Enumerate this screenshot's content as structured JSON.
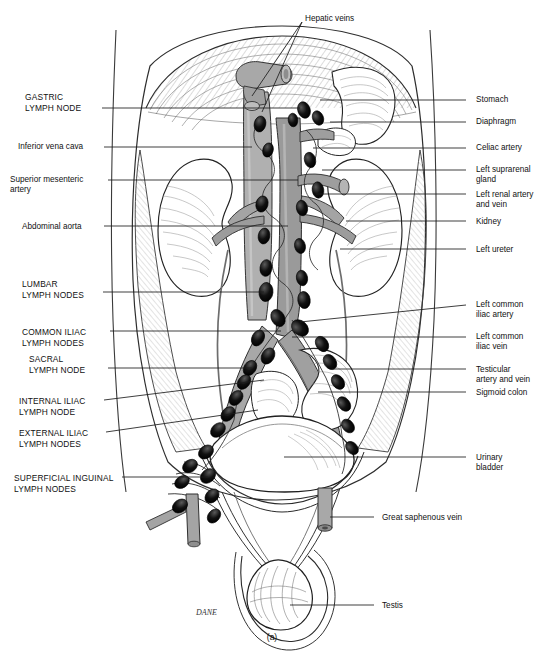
{
  "figure": {
    "caption": "(a)",
    "signature": "DANE"
  },
  "colors": {
    "ink": "#111111",
    "leader": "#222222",
    "vessel_light": "#b4b4b4",
    "vessel_mid": "#9a9a9a",
    "vessel_dark": "#7d7d7d",
    "node": "#000000",
    "hatch": "#7a7a7a",
    "background": "#ffffff"
  },
  "labels_left": [
    {
      "id": "gastric-lymph-node",
      "lines": [
        "GASTRIC",
        "LYMPH NODE"
      ],
      "caps": true,
      "x": 25,
      "y": 92,
      "lead_x1": 102,
      "lead_y1": 108,
      "lead_x2": 300,
      "lead_y2": 108
    },
    {
      "id": "inferior-vena-cava",
      "lines": [
        "Inferior vena cava"
      ],
      "caps": false,
      "x": 18,
      "y": 142,
      "lead_x1": 104,
      "lead_y1": 147,
      "lead_x2": 252,
      "lead_y2": 147
    },
    {
      "id": "superior-mesenteric-artery",
      "lines": [
        "Superior mesenteric",
        "artery"
      ],
      "caps": false,
      "x": 10,
      "y": 175,
      "lead_x1": 108,
      "lead_y1": 180,
      "lead_x2": 298,
      "lead_y2": 180
    },
    {
      "id": "abdominal-aorta",
      "lines": [
        "Abdominal aorta"
      ],
      "caps": false,
      "x": 22,
      "y": 222,
      "lead_x1": 104,
      "lead_y1": 226,
      "lead_x2": 288,
      "lead_y2": 226
    },
    {
      "id": "lumbar-lymph-nodes",
      "lines": [
        "LUMBAR",
        "LYMPH NODES"
      ],
      "caps": true,
      "x": 22,
      "y": 279,
      "lead_x1": 103,
      "lead_y1": 292,
      "lead_x2": 264,
      "lead_y2": 292
    },
    {
      "id": "common-iliac-lymph-nodes",
      "lines": [
        "COMMON ILIAC",
        "LYMPH NODES"
      ],
      "caps": true,
      "x": 22,
      "y": 327,
      "lead_x1": 110,
      "lead_y1": 331,
      "lead_x2": 281,
      "lead_y2": 331
    },
    {
      "id": "sacral-lymph-node",
      "lines": [
        "SACRAL",
        "LYMPH NODE"
      ],
      "caps": true,
      "x": 29,
      "y": 354,
      "lead_x1": 108,
      "lead_y1": 368,
      "lead_x2": 252,
      "lead_y2": 368
    },
    {
      "id": "internal-iliac-lymph-node",
      "lines": [
        "INTERNAL ILIAC",
        "LYMPH NODE"
      ],
      "caps": true,
      "x": 19,
      "y": 396,
      "lead_x1": 104,
      "lead_y1": 400,
      "lead_x2": 264,
      "lead_y2": 380
    },
    {
      "id": "external-iliac-lymph-nodes",
      "lines": [
        "EXTERNAL ILIAC",
        "LYMPH NODES"
      ],
      "caps": true,
      "x": 19,
      "y": 428,
      "lead_x1": 106,
      "lead_y1": 432,
      "lead_x2": 258,
      "lead_y2": 410
    },
    {
      "id": "superficial-inguinal-lymph-nodes",
      "lines": [
        "SUPERFICIAL INGUINAL",
        "LYMPH NODES"
      ],
      "caps": true,
      "x": 14,
      "y": 473,
      "lead_x1": 122,
      "lead_y1": 477,
      "lead_x2": 208,
      "lead_y2": 477
    }
  ],
  "labels_right": [
    {
      "id": "stomach",
      "lines": [
        "Stomach"
      ],
      "x": 476,
      "y": 95,
      "lead_x1": 466,
      "lead_y1": 100,
      "lead_x2": 320,
      "lead_y2": 100
    },
    {
      "id": "diaphragm",
      "lines": [
        "Diaphragm"
      ],
      "x": 476,
      "y": 117,
      "lead_x1": 466,
      "lead_y1": 122,
      "lead_x2": 330,
      "lead_y2": 122
    },
    {
      "id": "celiac-artery",
      "lines": [
        "Celiac artery"
      ],
      "x": 476,
      "y": 143,
      "lead_x1": 466,
      "lead_y1": 148,
      "lead_x2": 313,
      "lead_y2": 148
    },
    {
      "id": "left-suprarenal-gland",
      "lines": [
        "Left suprarenal",
        "gland"
      ],
      "x": 476,
      "y": 165,
      "lead_x1": 466,
      "lead_y1": 170,
      "lead_x2": 322,
      "lead_y2": 170
    },
    {
      "id": "left-renal-artery-and-vein",
      "lines": [
        "Left renal artery",
        "and vein"
      ],
      "x": 476,
      "y": 190,
      "lead_x1": 466,
      "lead_y1": 194,
      "lead_x2": 316,
      "lead_y2": 194
    },
    {
      "id": "kidney",
      "lines": [
        "Kidney"
      ],
      "x": 476,
      "y": 217,
      "lead_x1": 466,
      "lead_y1": 221,
      "lead_x2": 346,
      "lead_y2": 221
    },
    {
      "id": "left-ureter",
      "lines": [
        "Left ureter"
      ],
      "x": 476,
      "y": 245,
      "lead_x1": 466,
      "lead_y1": 249,
      "lead_x2": 340,
      "lead_y2": 249
    },
    {
      "id": "left-common-iliac-artery",
      "lines": [
        "Left common",
        "iliac artery"
      ],
      "x": 476,
      "y": 300,
      "lead_x1": 466,
      "lead_y1": 305,
      "lead_x2": 300,
      "lead_y2": 322
    },
    {
      "id": "left-common-iliac-vein",
      "lines": [
        "Left common",
        "iliac vein"
      ],
      "x": 476,
      "y": 332,
      "lead_x1": 466,
      "lead_y1": 337,
      "lead_x2": 292,
      "lead_y2": 337
    },
    {
      "id": "testicular-artery-and-vein",
      "lines": [
        "Testicular",
        "artery and vein"
      ],
      "x": 476,
      "y": 365,
      "lead_x1": 466,
      "lead_y1": 369,
      "lead_x2": 332,
      "lead_y2": 369
    },
    {
      "id": "sigmoid-colon",
      "lines": [
        "Sigmoid colon"
      ],
      "x": 476,
      "y": 388,
      "lead_x1": 466,
      "lead_y1": 392,
      "lead_x2": 318,
      "lead_y2": 392
    },
    {
      "id": "urinary-bladder",
      "lines": [
        "Urinary",
        "bladder"
      ],
      "x": 476,
      "y": 453,
      "lead_x1": 466,
      "lead_y1": 457,
      "lead_x2": 284,
      "lead_y2": 457
    },
    {
      "id": "great-saphenous-vein",
      "lines": [
        "Great saphenous vein"
      ],
      "x": 382,
      "y": 513,
      "lead_x1": 374,
      "lead_y1": 517,
      "lead_x2": 330,
      "lead_y2": 517
    },
    {
      "id": "testis",
      "lines": [
        "Testis"
      ],
      "x": 382,
      "y": 601,
      "lead_x1": 374,
      "lead_y1": 605,
      "lead_x2": 290,
      "lead_y2": 605
    }
  ],
  "labels_top": [
    {
      "id": "hepatic-veins",
      "lines": [
        "Hepatic veins"
      ],
      "x": 305,
      "y": 14,
      "leaders": [
        {
          "x1": 302,
          "y1": 22,
          "x2": 252,
          "y2": 96
        },
        {
          "x1": 302,
          "y1": 22,
          "x2": 262,
          "y2": 112
        }
      ]
    }
  ]
}
